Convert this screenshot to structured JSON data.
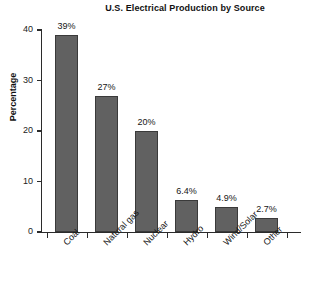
{
  "chart_data": {
    "type": "bar",
    "title": "U.S. Electrical Production by Source",
    "xlabel": "",
    "ylabel": "Percentage",
    "categories": [
      "Coal",
      "Natural gas",
      "Nuclear",
      "Hydro",
      "Wind/Solar",
      "Other"
    ],
    "values": [
      39,
      27,
      20,
      6.4,
      4.9,
      2.7
    ],
    "data_labels": [
      "39%",
      "27%",
      "20%",
      "6.4%",
      "4.9%",
      "2.7%"
    ],
    "ylim": [
      0,
      40
    ],
    "yticks": [
      0,
      10,
      20,
      30,
      40
    ],
    "ytick_labels": [
      "0",
      "10",
      "20",
      "30",
      "40"
    ],
    "grid": false,
    "legend": null,
    "bar_color": "#616161",
    "bar_edge_color": "#3a3a3a",
    "axis_color": "#2b2b2b",
    "background_color": "#ffffff",
    "text_color": "#161616"
  }
}
